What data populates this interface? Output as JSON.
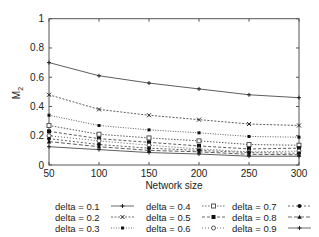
{
  "chart_data": {
    "type": "line",
    "title": "",
    "xlabel": "Network size",
    "ylabel": "M2",
    "ylabel_main": "M",
    "ylabel_sub": "2",
    "x": [
      50,
      100,
      150,
      200,
      250,
      300
    ],
    "xlim": [
      50,
      300
    ],
    "ylim": [
      0,
      1
    ],
    "xticks": [
      "50",
      "100",
      "150",
      "200",
      "250",
      "300"
    ],
    "yticks": [
      "0",
      "0.2",
      "0.4",
      "0.6",
      "0.8",
      "1"
    ],
    "grid": false,
    "legend_position": "bottom",
    "series": [
      {
        "name": "delta = 0.1",
        "values": [
          0.7,
          0.61,
          0.56,
          0.52,
          0.48,
          0.46
        ]
      },
      {
        "name": "delta = 0.2",
        "values": [
          0.48,
          0.38,
          0.34,
          0.31,
          0.28,
          0.27
        ]
      },
      {
        "name": "delta = 0.3",
        "values": [
          0.34,
          0.27,
          0.24,
          0.22,
          0.195,
          0.19
        ]
      },
      {
        "name": "delta = 0.4",
        "values": [
          0.27,
          0.21,
          0.185,
          0.165,
          0.14,
          0.135
        ]
      },
      {
        "name": "delta = 0.5",
        "values": [
          0.23,
          0.18,
          0.155,
          0.13,
          0.11,
          0.115
        ]
      },
      {
        "name": "delta = 0.6",
        "values": [
          0.2,
          0.165,
          0.135,
          0.11,
          0.09,
          0.095
        ]
      },
      {
        "name": "delta = 0.7",
        "values": [
          0.18,
          0.14,
          0.115,
          0.1,
          0.085,
          0.08
        ]
      },
      {
        "name": "delta = 0.8",
        "values": [
          0.16,
          0.125,
          0.1,
          0.09,
          0.073,
          0.07
        ]
      },
      {
        "name": "delta = 0.9",
        "values": [
          0.125,
          0.105,
          0.085,
          0.075,
          0.06,
          0.06
        ]
      }
    ]
  },
  "legend": {
    "items": [
      {
        "label": "delta = 0.1"
      },
      {
        "label": "delta = 0.2"
      },
      {
        "label": "delta = 0.3"
      },
      {
        "label": "delta = 0.4"
      },
      {
        "label": "delta = 0.5"
      },
      {
        "label": "delta = 0.6"
      },
      {
        "label": "delta = 0.7"
      },
      {
        "label": "delta = 0.8"
      },
      {
        "label": "delta = 0.9"
      }
    ]
  }
}
